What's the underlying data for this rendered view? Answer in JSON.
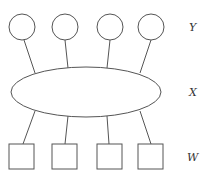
{
  "diagram": {
    "labels": {
      "top_row": "Y",
      "middle": "X",
      "bottom_row": "W"
    },
    "top_nodes": [
      {
        "shape": "circle",
        "cx": 22,
        "cy": 27,
        "r": 13
      },
      {
        "shape": "circle",
        "cx": 65,
        "cy": 27,
        "r": 13
      },
      {
        "shape": "circle",
        "cx": 110,
        "cy": 27,
        "r": 13
      },
      {
        "shape": "circle",
        "cx": 151,
        "cy": 27,
        "r": 13
      }
    ],
    "middle_node": {
      "shape": "ellipse",
      "cx": 86,
      "cy": 92,
      "rx": 75,
      "ry": 25
    },
    "bottom_nodes": [
      {
        "shape": "square",
        "x": 9,
        "y": 144,
        "size": 25
      },
      {
        "shape": "square",
        "x": 52,
        "y": 144,
        "size": 25
      },
      {
        "shape": "square",
        "x": 97,
        "y": 144,
        "size": 25
      },
      {
        "shape": "square",
        "x": 138,
        "y": 144,
        "size": 25
      }
    ],
    "edges_top": [
      {
        "x1": 24,
        "y1": 40,
        "x2": 35,
        "y2": 73
      },
      {
        "x1": 65,
        "y1": 40,
        "x2": 68,
        "y2": 68
      },
      {
        "x1": 110,
        "y1": 40,
        "x2": 107,
        "y2": 68
      },
      {
        "x1": 151,
        "y1": 40,
        "x2": 140,
        "y2": 73
      }
    ],
    "edges_bottom": [
      {
        "x1": 35,
        "y1": 111,
        "x2": 23,
        "y2": 144
      },
      {
        "x1": 68,
        "y1": 116,
        "x2": 65,
        "y2": 144
      },
      {
        "x1": 107,
        "y1": 116,
        "x2": 109,
        "y2": 144
      },
      {
        "x1": 140,
        "y1": 111,
        "x2": 151,
        "y2": 144
      }
    ],
    "label_positions": {
      "Y": {
        "x": 189,
        "y": 31
      },
      "X": {
        "x": 189,
        "y": 96
      },
      "W": {
        "x": 187,
        "y": 161
      }
    }
  }
}
